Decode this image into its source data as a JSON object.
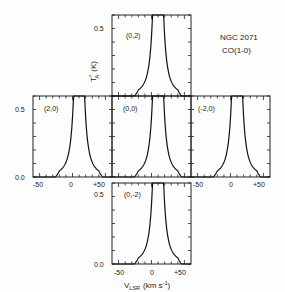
{
  "chart_data": {
    "type": "line",
    "title": "NGC 2071",
    "subtitle": "CO(1-0)",
    "xlabel": "V_LSR (km s-1)",
    "ylabel": "T_A* (K)",
    "xlim": [
      -60,
      60
    ],
    "ylim": [
      0.0,
      0.6
    ],
    "x_ticks": [
      "-50",
      "0",
      "+50"
    ],
    "y_ticks": [
      "0.0",
      "0.5"
    ],
    "panels": [
      {
        "label": "(0,2)",
        "position": "top",
        "peak_velocity": 10,
        "clipped_above": 0.6
      },
      {
        "label": "(2,0)",
        "position": "middle-left",
        "peak_velocity": 10,
        "clipped_above": 0.6
      },
      {
        "label": "(0,0)",
        "position": "middle-center",
        "peak_velocity": 10,
        "clipped_above": 0.6
      },
      {
        "label": "(-2,0)",
        "position": "middle-right",
        "peak_velocity": 10,
        "clipped_above": 0.6
      },
      {
        "label": "(0,-2)",
        "position": "bottom",
        "peak_velocity": 10,
        "clipped_above": 0.6
      }
    ]
  },
  "labels": {
    "title": "NGC 2071",
    "subtitle": "CO(1-0)",
    "ylabel": "T",
    "ylabel_sup": "*",
    "ylabel_sub": "A",
    "ylabel_unit": "(K)",
    "xlabel": "V",
    "xlabel_sub": "LSR",
    "xlabel_unit": "(km s",
    "xlabel_unit_sup": "-1",
    "xlabel_close": ")",
    "y05": "0.5",
    "y00": "0.0",
    "xm50": "-50",
    "x0": "0",
    "xp50": "+50",
    "p_top": "(0,2)",
    "p_left": "(2,0)",
    "p_center": "(0,0)",
    "p_right": "(-2,0)",
    "p_bottom": "(0,-2)"
  }
}
